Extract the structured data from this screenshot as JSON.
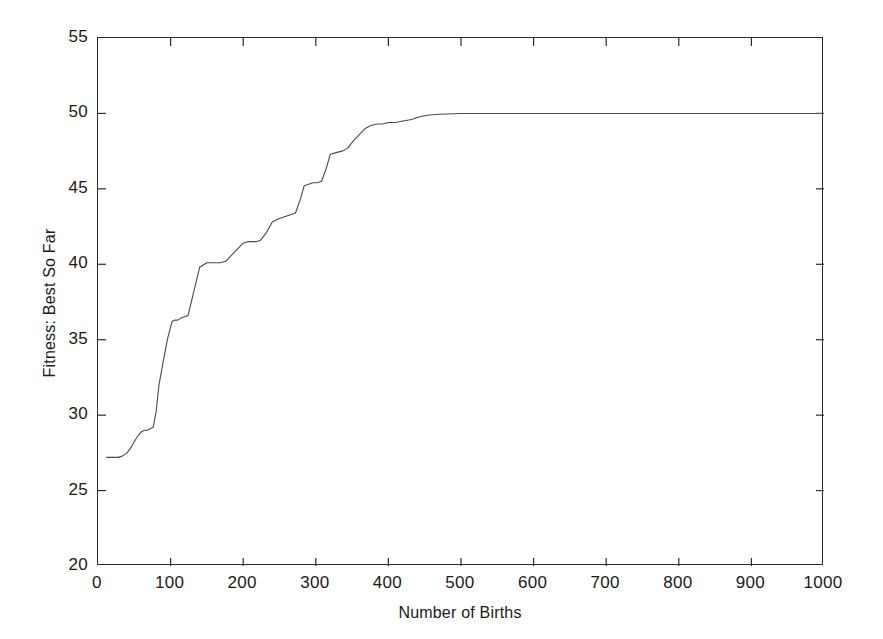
{
  "chart_data": {
    "type": "line",
    "title": "",
    "xlabel": "Number of Births",
    "ylabel": "Fitness: Best So Far",
    "xlim": [
      0,
      1000
    ],
    "ylim": [
      20,
      55
    ],
    "xticks": [
      0,
      100,
      200,
      300,
      400,
      500,
      600,
      700,
      800,
      900,
      1000
    ],
    "yticks": [
      20,
      25,
      30,
      35,
      40,
      45,
      50,
      55
    ],
    "grid": false,
    "legend": null,
    "line_color": "#4a4a4a",
    "line_width": 1.1,
    "series": [
      {
        "name": "Best So Far",
        "x": [
          12,
          20,
          28,
          34,
          40,
          46,
          52,
          56,
          60,
          64,
          68,
          72,
          76,
          80,
          84,
          90,
          96,
          102,
          106,
          110,
          113,
          118,
          124,
          132,
          140,
          150,
          160,
          168,
          176,
          182,
          190,
          196,
          200,
          206,
          212,
          218,
          224,
          232,
          240,
          248,
          254,
          260,
          266,
          272,
          278,
          284,
          290,
          296,
          302,
          308,
          314,
          320,
          328,
          336,
          344,
          352,
          360,
          368,
          376,
          384,
          392,
          400,
          410,
          420,
          432,
          444,
          456,
          470,
          500,
          540,
          600,
          680,
          760,
          840,
          920,
          1000
        ],
        "y": [
          27.2,
          27.2,
          27.2,
          27.3,
          27.5,
          27.9,
          28.4,
          28.7,
          28.9,
          29.0,
          29.0,
          29.1,
          29.2,
          30.2,
          32.0,
          33.6,
          35.1,
          36.2,
          36.3,
          36.3,
          36.4,
          36.5,
          36.6,
          38.2,
          39.8,
          40.1,
          40.1,
          40.1,
          40.2,
          40.5,
          40.9,
          41.2,
          41.4,
          41.5,
          41.5,
          41.5,
          41.6,
          42.1,
          42.8,
          43.0,
          43.1,
          43.2,
          43.3,
          43.4,
          44.2,
          45.2,
          45.3,
          45.4,
          45.4,
          45.5,
          46.3,
          47.3,
          47.4,
          47.5,
          47.7,
          48.2,
          48.6,
          49.0,
          49.2,
          49.3,
          49.3,
          49.4,
          49.4,
          49.5,
          49.6,
          49.8,
          49.9,
          49.95,
          50.0,
          50.0,
          50.0,
          50.0,
          50.0,
          50.0,
          50.0,
          50.0
        ]
      }
    ]
  },
  "axes": {
    "ytick_labels": [
      "55",
      "50",
      "45",
      "40",
      "35",
      "30",
      "25",
      "20"
    ],
    "xtick_labels": [
      "0",
      "100",
      "200",
      "300",
      "400",
      "500",
      "600",
      "700",
      "800",
      "900",
      "1000"
    ]
  }
}
